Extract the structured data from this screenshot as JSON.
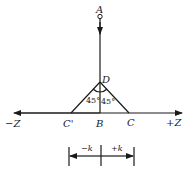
{
  "diagram": {
    "points": {
      "A": "A",
      "D": "D",
      "B": "B",
      "C": "C",
      "C_prime": "C'"
    },
    "axis": {
      "negative": "−Z",
      "positive": "+Z"
    },
    "angles": {
      "left": "45°",
      "right": "45°"
    },
    "dimension": {
      "negative": "−k",
      "positive": "+k"
    },
    "color": "#1a1a1a"
  }
}
